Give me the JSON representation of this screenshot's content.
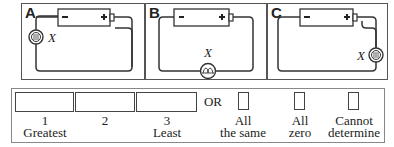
{
  "circuits": [
    {
      "label": "A",
      "bulb_label": "X",
      "bulb_position": "left",
      "battery": {
        "negative": "−",
        "positive": "+"
      }
    },
    {
      "label": "B",
      "bulb_label": "X",
      "bulb_position": "bottom",
      "battery": {
        "negative": "−",
        "positive": "+"
      }
    },
    {
      "label": "C",
      "bulb_label": "X",
      "bulb_position": "right",
      "battery": {
        "negative": "−",
        "positive": "+"
      }
    }
  ],
  "answer": {
    "ranks": [
      {
        "number": "1",
        "caption": "Greatest"
      },
      {
        "number": "2",
        "caption": ""
      },
      {
        "number": "3",
        "caption": "Least"
      }
    ],
    "or_label": "OR",
    "options": [
      {
        "line1": "All",
        "line2": "the same"
      },
      {
        "line1": "All",
        "line2": "zero"
      },
      {
        "line1": "Cannot",
        "line2": "determine"
      }
    ]
  }
}
